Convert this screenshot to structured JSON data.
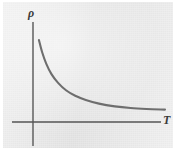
{
  "figure": {
    "name": "resistivity-vs-temperature-plot",
    "background_color": "#eeeeee",
    "page_color": "#ffffff",
    "ink_color": "#6a6a6a",
    "label_color": "#3a3a3a"
  },
  "axes": {
    "y_label": "ρ",
    "x_label": "T",
    "y_label_name": "rho",
    "x_label_name": "T",
    "origin_x": 33,
    "origin_y": 122,
    "y_axis_top": 22,
    "y_axis_bottom": 146,
    "x_axis_left": 12,
    "x_axis_right": 161
  },
  "chart_data": {
    "type": "line",
    "title": "",
    "subtitle": "",
    "xlabel": "T",
    "ylabel": "ρ",
    "grid": false,
    "legend": null,
    "annotations": [],
    "xticks": [],
    "yticks": [],
    "xlim": [
      0,
      10
    ],
    "ylim": [
      0,
      10
    ],
    "series": [
      {
        "name": "resistivity",
        "description": "monotonically decreasing convex curve approaching a horizontal asymptote",
        "x": [
          0.45,
          0.7,
          1.0,
          1.4,
          1.9,
          2.5,
          3.2,
          4.0,
          5.0,
          6.2,
          7.4,
          8.6,
          10.0
        ],
        "y": [
          8.9,
          7.55,
          6.35,
          5.2,
          4.25,
          3.45,
          2.85,
          2.4,
          2.0,
          1.7,
          1.52,
          1.42,
          1.35
        ]
      }
    ]
  }
}
